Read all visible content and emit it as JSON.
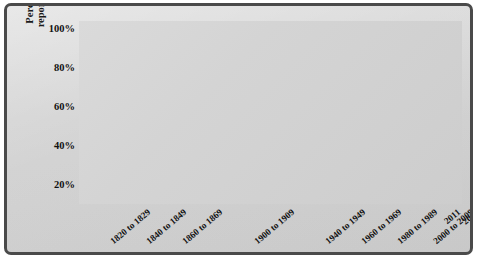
{
  "chart_data": {
    "type": "line",
    "title": "",
    "xlabel": "",
    "ylabel": "Percentage of immigrants reporting European origins",
    "ylabel_line1": "Percentage of immigrants",
    "ylabel_line2": "reporting European origins",
    "ylim": [
      10,
      100
    ],
    "yticks": [
      20,
      40,
      60,
      80,
      100
    ],
    "ytick_labels": [
      "20%",
      "40%",
      "60%",
      "80%",
      "100%"
    ],
    "grid": true,
    "legend": "none",
    "line_color": "#6b6b6b",
    "plot_background": "#d5d5d5",
    "gridline_color": "#ffffff",
    "frame_color": "#4a4a4a",
    "categories": [
      "1820 to 1829",
      "1830 to 1839",
      "1840 to 1849",
      "1850 to 1859",
      "1860 to 1869",
      "1870 to 1879",
      "1880 to 1889",
      "1890 to 1899",
      "1900 to 1909",
      "1910 to 1919",
      "1920 to 1929",
      "1930 to 1939",
      "1940 to 1949",
      "1950 to 1959",
      "1960 to 1969",
      "1970 to 1979",
      "1980 to 1989",
      "1990 to 1999",
      "2000 to 2009",
      "2011",
      "2013",
      "2015"
    ],
    "xtick_labels": [
      "1820 to 1829",
      "1840 to 1849",
      "1860 to 1869",
      "1900 to 1909",
      "1940 to 1949",
      "1960 to 1969",
      "1980 to 1989",
      "2000 to 2009",
      "2011",
      "2013",
      "2015"
    ],
    "xtick_indices": [
      0,
      2,
      4,
      8,
      12,
      14,
      16,
      18,
      19,
      20,
      21
    ],
    "values": [
      78,
      79,
      97,
      93,
      91,
      83,
      89,
      96,
      97,
      93,
      80,
      58,
      64,
      63,
      52,
      34,
      17,
      19,
      18,
      16,
      16,
      16
    ],
    "series": [
      {
        "name": "Percentage of immigrants reporting European origins",
        "values": [
          78,
          79,
          97,
          93,
          91,
          83,
          89,
          96,
          97,
          93,
          80,
          58,
          64,
          63,
          52,
          34,
          17,
          19,
          18,
          16,
          16,
          16
        ]
      }
    ]
  }
}
